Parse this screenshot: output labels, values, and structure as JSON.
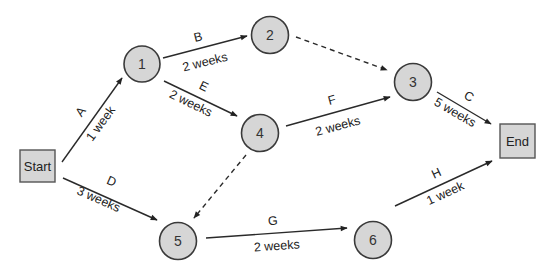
{
  "diagram": {
    "type": "project network (activity-on-arrow)",
    "nodes": {
      "start": {
        "label": "Start"
      },
      "n1": {
        "label": "1"
      },
      "n2": {
        "label": "2"
      },
      "n3": {
        "label": "3"
      },
      "n4": {
        "label": "4"
      },
      "n5": {
        "label": "5"
      },
      "n6": {
        "label": "6"
      },
      "end": {
        "label": "End"
      }
    },
    "edges": {
      "A": {
        "activity": "A",
        "duration": "1 week",
        "from": "Start",
        "to": "1"
      },
      "B": {
        "activity": "B",
        "duration": "2 weeks",
        "from": "1",
        "to": "2"
      },
      "C": {
        "activity": "C",
        "duration": "5 weeks",
        "from": "3",
        "to": "End"
      },
      "D": {
        "activity": "D",
        "duration": "3 weeks",
        "from": "Start",
        "to": "5"
      },
      "E": {
        "activity": "E",
        "duration": "2 weeks",
        "from": "1",
        "to": "4"
      },
      "F": {
        "activity": "F",
        "duration": "2 weeks",
        "from": "4",
        "to": "3"
      },
      "G": {
        "activity": "G",
        "duration": "2 weeks",
        "from": "5",
        "to": "6"
      },
      "H": {
        "activity": "H",
        "duration": "1 week",
        "from": "6",
        "to": "End"
      },
      "dummy_2_3": {
        "from": "2",
        "to": "3",
        "style": "dashed"
      },
      "dummy_4_5": {
        "from": "4",
        "to": "5",
        "style": "dashed"
      }
    },
    "colors": {
      "node_fill": "#d6d6d6",
      "stroke": "#2a2a2a",
      "text": "#222222"
    }
  }
}
